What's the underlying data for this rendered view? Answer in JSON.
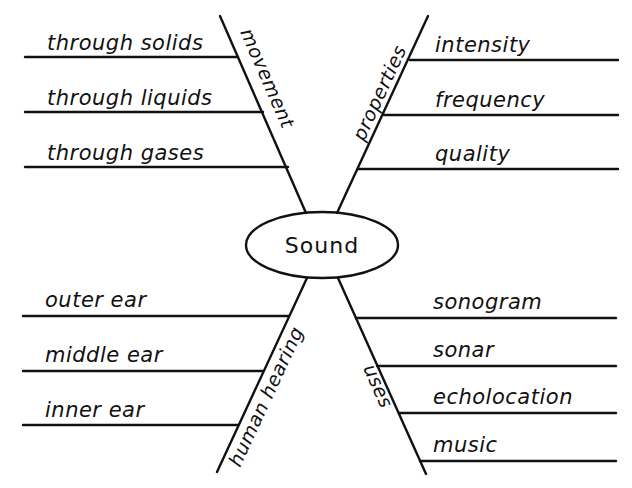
{
  "diagram": {
    "type": "fishbone-organizer",
    "center": {
      "label": "Sound"
    },
    "branches": [
      {
        "id": "movement",
        "category": "movement",
        "position": "top-left",
        "items": [
          "through solids",
          "through liquids",
          "through gases"
        ]
      },
      {
        "id": "properties",
        "category": "properties",
        "position": "top-right",
        "items": [
          "intensity",
          "frequency",
          "quality"
        ]
      },
      {
        "id": "human-hearing",
        "category": "human hearing",
        "position": "bottom-left",
        "items": [
          "outer ear",
          "middle ear",
          "inner ear"
        ]
      },
      {
        "id": "uses",
        "category": "uses",
        "position": "bottom-right",
        "items": [
          "sonogram",
          "sonar",
          "echolocation",
          "music"
        ]
      }
    ]
  },
  "colors": {
    "ink": "#111111",
    "background": "#ffffff"
  }
}
